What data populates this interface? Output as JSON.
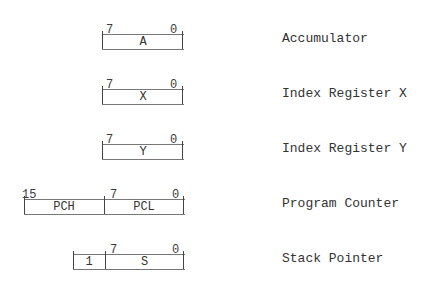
{
  "registers": [
    {
      "name": "Accumulator",
      "cells": [
        "A"
      ],
      "bits": {
        "high": "7",
        "low": "0"
      }
    },
    {
      "name": "Index Register X",
      "cells": [
        "X"
      ],
      "bits": {
        "high": "7",
        "low": "0"
      }
    },
    {
      "name": "Index Register Y",
      "cells": [
        "Y"
      ],
      "bits": {
        "high": "7",
        "low": "0"
      }
    },
    {
      "name": "Program Counter",
      "cells": [
        "PCH",
        "PCL"
      ],
      "bits": {
        "top": "15",
        "high": "7",
        "low": "0"
      }
    },
    {
      "name": "Stack Pointer",
      "cells": [
        "1",
        "S"
      ],
      "bits": {
        "high": "7",
        "low": "0"
      }
    }
  ]
}
